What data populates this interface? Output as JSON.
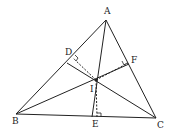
{
  "diagram": {
    "type": "triangle-incenter",
    "colors": {
      "stroke": "#222222",
      "background": "#ffffff"
    },
    "points": {
      "A": {
        "label": "A",
        "x": 106,
        "y": 20
      },
      "B": {
        "label": "B",
        "x": 16,
        "y": 114
      },
      "C": {
        "label": "C",
        "x": 156,
        "y": 118
      },
      "I": {
        "label": "I",
        "x": 96,
        "y": 80
      },
      "D": {
        "label": "D",
        "x": 69,
        "y": 61
      },
      "E": {
        "label": "E",
        "x": 97,
        "y": 117
      },
      "F": {
        "label": "F",
        "x": 129,
        "y": 63
      }
    },
    "labels": {
      "A": "A",
      "B": "B",
      "C": "C",
      "D": "D",
      "E": "E",
      "F": "F",
      "I": "I"
    }
  }
}
